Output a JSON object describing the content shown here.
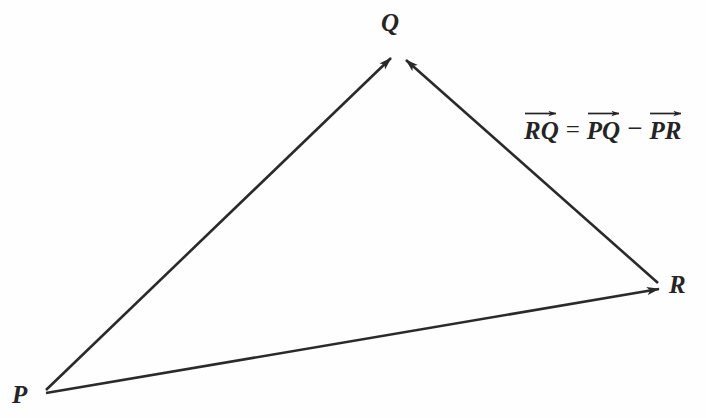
{
  "figure": {
    "kind": "vector-triangle-diagram",
    "width": 706,
    "height": 418,
    "background_color": "#fefefe",
    "ink_color": "#2a2a2a"
  },
  "points": {
    "P": {
      "label": "P",
      "x": 42,
      "y": 394
    },
    "Q": {
      "label": "Q",
      "x": 398,
      "y": 52
    },
    "R": {
      "label": "R",
      "x": 663,
      "y": 288
    }
  },
  "vectors": [
    {
      "name": "PQ",
      "from": "P",
      "to": "Q",
      "arrowhead_at": "Q"
    },
    {
      "name": "RQ",
      "from": "R",
      "to": "Q",
      "arrowhead_at": "Q"
    },
    {
      "name": "PR",
      "from": "P",
      "to": "R",
      "arrowhead_at": "R"
    }
  ],
  "equation": {
    "full_text": "RQ = PQ - PR",
    "terms": {
      "lhs": "RQ",
      "equals": "=",
      "term1": "PQ",
      "minus": "−",
      "term2": "PR"
    }
  }
}
